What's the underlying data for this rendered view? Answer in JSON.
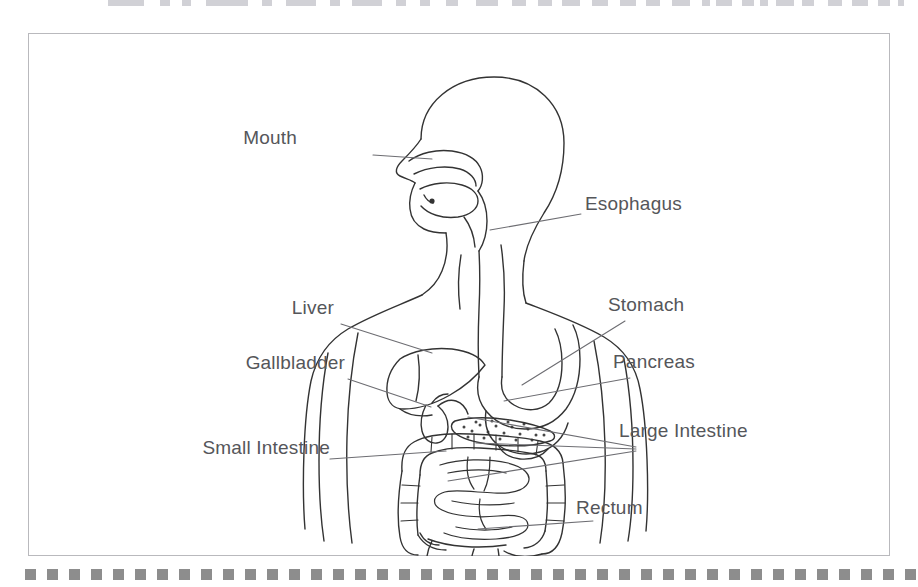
{
  "page": {
    "background_color": "#ffffff",
    "frame_color": "#b9b9bd",
    "ink_color": "#333333",
    "label_color": "#55565a",
    "decor_color": "#8d8d8d"
  },
  "top_crop_strip": {
    "description": "cropped bottom fragments of a cut-off line of text above the page",
    "fragment_color": "#c9c9cf",
    "fragments": [
      {
        "x": 108,
        "w": 36
      },
      {
        "x": 160,
        "w": 10
      },
      {
        "x": 182,
        "w": 9
      },
      {
        "x": 206,
        "w": 42
      },
      {
        "x": 262,
        "w": 10
      },
      {
        "x": 286,
        "w": 30
      },
      {
        "x": 330,
        "w": 10
      },
      {
        "x": 352,
        "w": 30
      },
      {
        "x": 396,
        "w": 10
      },
      {
        "x": 420,
        "w": 10
      },
      {
        "x": 446,
        "w": 12
      },
      {
        "x": 476,
        "w": 22
      },
      {
        "x": 512,
        "w": 14
      },
      {
        "x": 538,
        "w": 14
      },
      {
        "x": 562,
        "w": 18
      },
      {
        "x": 592,
        "w": 16
      },
      {
        "x": 620,
        "w": 16
      },
      {
        "x": 646,
        "w": 14
      },
      {
        "x": 672,
        "w": 18
      },
      {
        "x": 702,
        "w": 8
      },
      {
        "x": 716,
        "w": 16
      },
      {
        "x": 742,
        "w": 12
      },
      {
        "x": 760,
        "w": 8
      },
      {
        "x": 776,
        "w": 18
      },
      {
        "x": 802,
        "w": 12
      },
      {
        "x": 828,
        "w": 14
      },
      {
        "x": 852,
        "w": 16
      },
      {
        "x": 878,
        "w": 12
      },
      {
        "x": 898,
        "w": 6
      }
    ]
  },
  "figure": {
    "name": "digestive-system-anatomical-diagram",
    "view": "human torso, head in left profile, frontal body outline",
    "organs": [
      "mouth",
      "esophagus",
      "stomach",
      "liver",
      "gallbladder",
      "pancreas",
      "small-intestine",
      "large-intestine",
      "rectum"
    ]
  },
  "labels": [
    {
      "id": "mouth",
      "text": "Mouth",
      "side": "left",
      "x": 297,
      "y": 138
    },
    {
      "id": "esophagus",
      "text": "Esophagus",
      "side": "right",
      "x": 585,
      "y": 204
    },
    {
      "id": "liver",
      "text": "Liver",
      "side": "left",
      "x": 262,
      "y": 308
    },
    {
      "id": "stomach",
      "text": "Stomach",
      "side": "right",
      "x": 608,
      "y": 305
    },
    {
      "id": "gallbladder",
      "text": "Gallbladder",
      "side": "left",
      "x": 228,
      "y": 363
    },
    {
      "id": "pancreas",
      "text": "Pancreas",
      "side": "right",
      "x": 613,
      "y": 362
    },
    {
      "id": "large-intestine",
      "text": "Large Intestine",
      "side": "right",
      "x": 619,
      "y": 431
    },
    {
      "id": "small-intestine",
      "text": "Small Intestine",
      "side": "left",
      "x": 197,
      "y": 448
    },
    {
      "id": "rectum",
      "text": "Rectum",
      "side": "right",
      "x": 576,
      "y": 508
    }
  ],
  "bottom_square_strip": {
    "square_size": 11,
    "spacing": 22,
    "start_x": 25,
    "count": 41,
    "color": "#8d8d8d"
  }
}
